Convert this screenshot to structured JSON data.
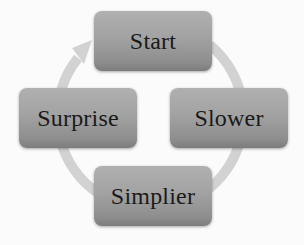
{
  "diagram": {
    "type": "cycle",
    "direction": "clockwise",
    "nodes": [
      {
        "id": "start",
        "label": "Start"
      },
      {
        "id": "slower",
        "label": "Slower"
      },
      {
        "id": "simplier",
        "label": "Simplier"
      },
      {
        "id": "surprise",
        "label": "Surprise"
      }
    ],
    "edges": [
      {
        "from": "start",
        "to": "slower"
      },
      {
        "from": "slower",
        "to": "simplier"
      },
      {
        "from": "simplier",
        "to": "surprise"
      },
      {
        "from": "surprise",
        "to": "start"
      }
    ]
  },
  "colors": {
    "background": "#fbfbfb",
    "node_fill_top": "#b0b0b0",
    "node_fill_bottom": "#7c7c7c",
    "ring": "#d4d4d4",
    "text": "#1a1a1a"
  }
}
